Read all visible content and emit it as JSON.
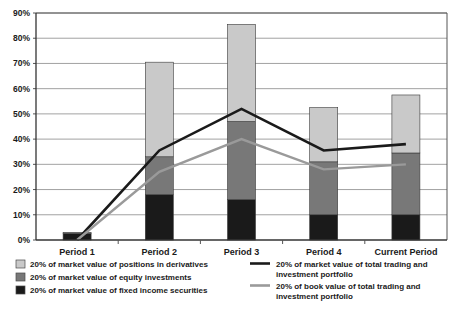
{
  "chart_data": {
    "type": "bar",
    "subtype": "stacked-bar-with-lines",
    "title": "",
    "xlabel": "",
    "ylabel": "",
    "categories": [
      "Period 1",
      "Period 2",
      "Period 3",
      "Period 4",
      "Current Period"
    ],
    "ylim": [
      0,
      90
    ],
    "ytick_labels": [
      "0%",
      "10%",
      "20%",
      "30%",
      "40%",
      "50%",
      "60%",
      "70%",
      "80%",
      "90%"
    ],
    "ytick_values": [
      0,
      10,
      20,
      30,
      40,
      50,
      60,
      70,
      80,
      90
    ],
    "grid": true,
    "legend_position": "bottom",
    "series": [
      {
        "name": "20% of market value of fixed income securities",
        "type": "bar",
        "stack_order": 0,
        "color": "#1a1a1a",
        "values": [
          2.5,
          18,
          16,
          10,
          10
        ]
      },
      {
        "name": "20% of market value of equity investments",
        "type": "bar",
        "stack_order": 1,
        "color": "#787878",
        "values": [
          0.5,
          15,
          31,
          21,
          24.5
        ]
      },
      {
        "name": "20% of market value of positions in derivatives",
        "type": "bar",
        "stack_order": 2,
        "color": "#c9c9c9",
        "values": [
          0,
          37.5,
          38.5,
          21.5,
          23
        ]
      },
      {
        "name": "20% of market value of total trading and investment portfolio",
        "type": "line",
        "color": "#1a1a1a",
        "values": [
          0,
          35.5,
          52,
          35.5,
          38
        ]
      },
      {
        "name": "20% of book value of total trading and investment portfolio",
        "type": "line",
        "color": "#9a9a9a",
        "values": [
          0,
          27,
          40,
          28,
          30
        ]
      }
    ],
    "stack_totals": [
      3,
      70.5,
      85.5,
      52.5,
      57.5
    ]
  },
  "legend": {
    "left_items": [
      {
        "label": "20% of market value of positions in derivatives",
        "swatch": "#c9c9c9",
        "marker": "square"
      },
      {
        "label": "20% of market value of equity investments",
        "swatch": "#787878",
        "marker": "square"
      },
      {
        "label": "20% of market value of fixed income securities",
        "swatch": "#1a1a1a",
        "marker": "square"
      }
    ],
    "right_items": [
      {
        "label_line1": "20% of market value of total trading and",
        "label_line2": "investment portfolio",
        "swatch": "#1a1a1a",
        "marker": "line"
      },
      {
        "label_line1": "20% of book value of total trading and",
        "label_line2": "investment portfolio",
        "swatch": "#9a9a9a",
        "marker": "line"
      }
    ]
  },
  "axis": {
    "y_labels": [
      "90%",
      "80%",
      "70%",
      "60%",
      "50%",
      "40%",
      "30%",
      "20%",
      "10%",
      "0%"
    ],
    "x_labels": [
      "Period 1",
      "Period 2",
      "Period 3",
      "Period 4",
      "Current Period"
    ]
  },
  "colors": {
    "derivatives": "#c9c9c9",
    "equity": "#787878",
    "fixed_income": "#1a1a1a",
    "market_value_line": "#1a1a1a",
    "book_value_line": "#9a9a9a",
    "grid": "#8a8a8a",
    "frame": "#555555",
    "background": "#ffffff"
  }
}
